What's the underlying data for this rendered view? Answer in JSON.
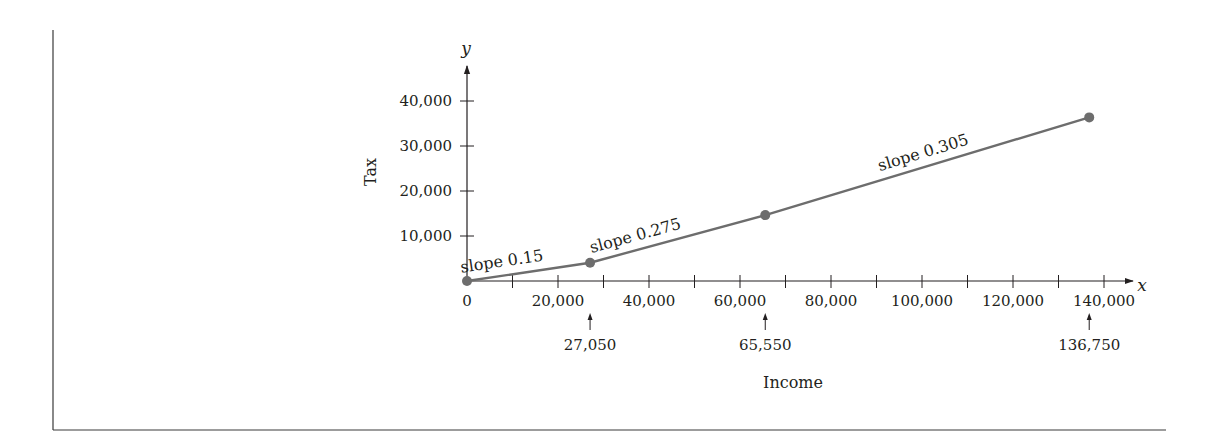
{
  "chart_data": {
    "type": "line",
    "title": "",
    "xlabel": "Income",
    "ylabel": "Tax",
    "x_axis_var": "x",
    "y_axis_var": "y",
    "xlim": [
      0,
      145000
    ],
    "ylim": [
      0,
      45000
    ],
    "grid": false,
    "x_ticks": [
      0,
      10000,
      20000,
      30000,
      40000,
      50000,
      60000,
      70000,
      80000,
      90000,
      100000,
      110000,
      120000,
      130000,
      140000
    ],
    "x_tick_labels": [
      "0",
      "20,000",
      "40,000",
      "60,000",
      "80,000",
      "100,000",
      "120,000",
      "140,000"
    ],
    "x_tick_label_values": [
      0,
      20000,
      40000,
      60000,
      80000,
      100000,
      120000,
      140000
    ],
    "y_ticks": [
      10000,
      20000,
      30000,
      40000
    ],
    "y_tick_labels": [
      "10,000",
      "20,000",
      "30,000",
      "40,000"
    ],
    "series": [
      {
        "name": "Tax",
        "color": "#6d6d6d",
        "x": [
          0,
          27050,
          65550,
          136750
        ],
        "y": [
          0,
          4057.5,
          14645,
          36361
        ]
      }
    ],
    "breakpoints": [
      {
        "value": 27050,
        "label": "27,050"
      },
      {
        "value": 65550,
        "label": "65,550"
      },
      {
        "value": 136750,
        "label": "136,750"
      }
    ],
    "annotations": [
      {
        "text": "slope 0.15",
        "segment": 0
      },
      {
        "text": "slope 0.275",
        "segment": 1
      },
      {
        "text": "slope 0.305",
        "segment": 2
      }
    ]
  },
  "colors": {
    "curve": "#6d6d6d",
    "axis": "#231f20",
    "frame": "#3a3a3a"
  }
}
